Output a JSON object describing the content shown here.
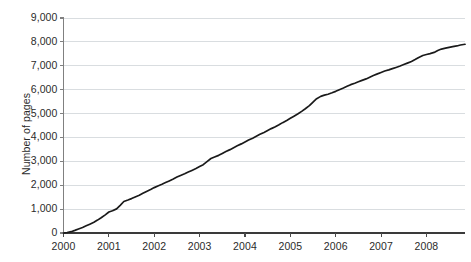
{
  "chart_data": {
    "type": "line",
    "title": "",
    "subtitle": "",
    "xlabel": "",
    "ylabel": "Number of pages",
    "xlim": [
      2000,
      2008.85
    ],
    "ylim": [
      0,
      9000
    ],
    "grid": true,
    "grid_axis": "y",
    "legend": false,
    "legend_position": "none",
    "line_color": "#1a1a1a",
    "grid_color": "#d9dde0",
    "axis_color": "#808080",
    "background_color": "#ffffff",
    "x_ticks": [
      2000,
      2001,
      2002,
      2003,
      2004,
      2005,
      2006,
      2007,
      2008
    ],
    "x_tick_labels": [
      "2000",
      "2001",
      "2002",
      "2003",
      "2004",
      "2005",
      "2006",
      "2007",
      "2008"
    ],
    "y_ticks": [
      0,
      1000,
      2000,
      3000,
      4000,
      5000,
      6000,
      7000,
      8000,
      9000
    ],
    "y_tick_labels": [
      "0",
      "1,000",
      "2,000",
      "3,000",
      "4,000",
      "5,000",
      "6,000",
      "7,000",
      "8,000",
      "9,000"
    ],
    "series": [
      {
        "name": "Number of pages",
        "x": [
          2000.0,
          2000.08,
          2000.17,
          2000.25,
          2000.33,
          2000.42,
          2000.5,
          2000.58,
          2000.67,
          2000.75,
          2000.83,
          2000.92,
          2001.0,
          2001.08,
          2001.17,
          2001.25,
          2001.33,
          2001.42,
          2001.5,
          2001.58,
          2001.67,
          2001.75,
          2001.83,
          2001.92,
          2002.0,
          2002.08,
          2002.17,
          2002.25,
          2002.33,
          2002.42,
          2002.5,
          2002.58,
          2002.67,
          2002.75,
          2002.83,
          2002.92,
          2003.0,
          2003.08,
          2003.17,
          2003.25,
          2003.33,
          2003.42,
          2003.5,
          2003.58,
          2003.67,
          2003.75,
          2003.83,
          2003.92,
          2004.0,
          2004.08,
          2004.17,
          2004.25,
          2004.33,
          2004.42,
          2004.5,
          2004.58,
          2004.67,
          2004.75,
          2004.83,
          2004.92,
          2005.0,
          2005.08,
          2005.17,
          2005.25,
          2005.33,
          2005.42,
          2005.5,
          2005.58,
          2005.67,
          2005.75,
          2005.83,
          2005.92,
          2006.0,
          2006.08,
          2006.17,
          2006.25,
          2006.33,
          2006.42,
          2006.5,
          2006.58,
          2006.67,
          2006.75,
          2006.83,
          2006.92,
          2007.0,
          2007.08,
          2007.17,
          2007.25,
          2007.33,
          2007.42,
          2007.5,
          2007.58,
          2007.67,
          2007.75,
          2007.83,
          2007.92,
          2008.0,
          2008.08,
          2008.17,
          2008.25,
          2008.33,
          2008.42,
          2008.5,
          2008.58,
          2008.67,
          2008.75,
          2008.85
        ],
        "values": [
          0,
          20,
          55,
          110,
          170,
          230,
          300,
          370,
          450,
          540,
          640,
          760,
          880,
          930,
          1010,
          1160,
          1320,
          1380,
          1440,
          1510,
          1580,
          1660,
          1740,
          1820,
          1900,
          1970,
          2040,
          2110,
          2180,
          2260,
          2340,
          2410,
          2480,
          2550,
          2620,
          2700,
          2780,
          2860,
          3000,
          3120,
          3180,
          3250,
          3330,
          3410,
          3490,
          3570,
          3650,
          3730,
          3810,
          3890,
          3970,
          4050,
          4130,
          4210,
          4290,
          4370,
          4450,
          4530,
          4620,
          4710,
          4800,
          4890,
          4990,
          5090,
          5200,
          5330,
          5480,
          5620,
          5720,
          5770,
          5810,
          5870,
          5930,
          6000,
          6070,
          6140,
          6210,
          6270,
          6330,
          6390,
          6450,
          6520,
          6590,
          6660,
          6720,
          6780,
          6830,
          6880,
          6930,
          6990,
          7050,
          7110,
          7180,
          7260,
          7350,
          7430,
          7470,
          7510,
          7560,
          7640,
          7700,
          7740,
          7770,
          7800,
          7830,
          7870,
          7900
        ]
      }
    ]
  }
}
